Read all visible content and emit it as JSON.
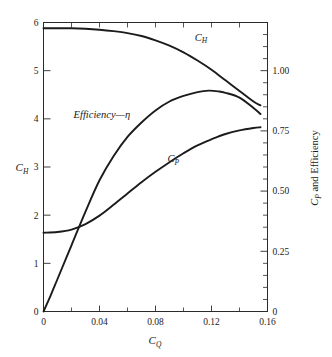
{
  "chart_data": {
    "type": "line",
    "title": "",
    "xlabel": "C_Q",
    "ylabel": "C_H",
    "ylabel_right": "C_P and Efficiency",
    "xlim": [
      0,
      0.16
    ],
    "ylim": [
      0,
      6
    ],
    "ylim_right": [
      0,
      1.2
    ],
    "grid": false,
    "legend_position": "inline-curve-labels",
    "x_ticks": [
      "0",
      "0.04",
      "0.08",
      "0.12",
      "0.16"
    ],
    "x_tick_values": [
      0,
      0.04,
      0.08,
      0.12,
      0.16
    ],
    "x_minor_tick_values": [
      0.02,
      0.06,
      0.1,
      0.14
    ],
    "y_ticks_left": [
      "0",
      "1",
      "2",
      "3",
      "4",
      "5",
      "6"
    ],
    "y_tick_values_left": [
      0,
      1,
      2,
      3,
      4,
      5,
      6
    ],
    "y_ticks_right": [
      "0",
      "0.25",
      "0.50",
      "0.75",
      "1.00"
    ],
    "y_tick_values_right": [
      0,
      0.25,
      0.5,
      0.75,
      1.0
    ],
    "y_minor_tick_values_right": [
      0.05,
      0.1,
      0.15,
      0.2,
      0.3,
      0.35,
      0.4,
      0.45,
      0.55,
      0.6,
      0.65,
      0.7,
      0.8,
      0.85,
      0.9,
      0.95,
      1.05,
      1.1,
      1.15
    ],
    "series": [
      {
        "name": "C_H",
        "label": "C",
        "label_sub": "H",
        "axis": "left",
        "label_x": 0.108,
        "label_y": 5.62,
        "x": [
          0,
          0.01,
          0.02,
          0.03,
          0.04,
          0.05,
          0.06,
          0.07,
          0.08,
          0.09,
          0.1,
          0.11,
          0.12,
          0.13,
          0.14,
          0.15,
          0.155
        ],
        "y": [
          5.88,
          5.88,
          5.88,
          5.87,
          5.85,
          5.82,
          5.78,
          5.72,
          5.63,
          5.52,
          5.38,
          5.21,
          5.02,
          4.8,
          4.58,
          4.36,
          4.28
        ]
      },
      {
        "name": "Efficiency",
        "label": "Efficiency—η",
        "axis": "right",
        "label_x": 0.0215,
        "label_y_left_scale": 4.02,
        "x": [
          0,
          0.005,
          0.01,
          0.02,
          0.03,
          0.04,
          0.05,
          0.06,
          0.07,
          0.08,
          0.09,
          0.1,
          0.11,
          0.118,
          0.125,
          0.13,
          0.14,
          0.15,
          0.155
        ],
        "y": [
          0,
          0.065,
          0.135,
          0.275,
          0.415,
          0.545,
          0.645,
          0.725,
          0.785,
          0.835,
          0.872,
          0.895,
          0.911,
          0.917,
          0.914,
          0.908,
          0.888,
          0.845,
          0.82
        ],
        "y_left_scale": [
          0,
          0.33,
          0.68,
          1.38,
          2.08,
          2.73,
          3.23,
          3.63,
          3.93,
          4.18,
          4.36,
          4.48,
          4.56,
          4.585,
          4.57,
          4.54,
          4.44,
          4.23,
          4.1
        ]
      },
      {
        "name": "C_P",
        "label": "C",
        "label_sub": "P",
        "axis": "right",
        "label_x": 0.0885,
        "label_y_left_scale": 3.1,
        "x": [
          0,
          0.01,
          0.02,
          0.03,
          0.04,
          0.05,
          0.06,
          0.07,
          0.08,
          0.09,
          0.1,
          0.11,
          0.12,
          0.13,
          0.14,
          0.15,
          0.155
        ],
        "y": [
          0.327,
          0.33,
          0.34,
          0.363,
          0.398,
          0.443,
          0.49,
          0.537,
          0.58,
          0.62,
          0.657,
          0.69,
          0.715,
          0.737,
          0.752,
          0.762,
          0.765
        ],
        "y_left_scale": [
          1.635,
          1.65,
          1.7,
          1.815,
          1.99,
          2.215,
          2.45,
          2.685,
          2.9,
          3.1,
          3.285,
          3.45,
          3.575,
          3.685,
          3.76,
          3.81,
          3.825
        ]
      }
    ]
  },
  "labels": {
    "y_axis_left_title": "C",
    "y_axis_left_sub": "H",
    "x_axis_title": "C",
    "x_axis_sub": "Q",
    "y_axis_right_title_part1": "C",
    "y_axis_right_sub": "P",
    "y_axis_right_title_part2": " and Efficiency",
    "efficiency_label": "Efficiency—η",
    "ch_label": "C",
    "ch_label_sub": "H",
    "cp_label": "C",
    "cp_label_sub": "P"
  },
  "colors": {
    "curve": "#1b1b1b",
    "axis": "#2b2b2b",
    "background": "#ffffff",
    "text": "#1a1a1a"
  }
}
